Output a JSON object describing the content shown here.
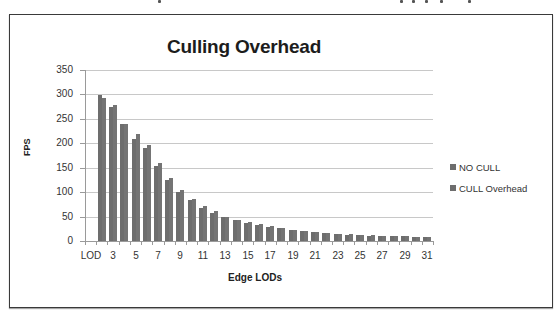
{
  "chart_data": {
    "type": "bar",
    "title": "Culling Overhead",
    "xlabel": "Edge LODs",
    "ylabel": "FPS",
    "ylim": [
      0,
      350
    ],
    "yticks": [
      0,
      50,
      100,
      150,
      200,
      250,
      300,
      350
    ],
    "grid": true,
    "legend_position": "right",
    "categories": [
      "LOD",
      "2",
      "3",
      "4",
      "5",
      "6",
      "7",
      "8",
      "9",
      "10",
      "11",
      "12",
      "13",
      "14",
      "15",
      "16",
      "17",
      "18",
      "19",
      "20",
      "21",
      "22",
      "23",
      "24",
      "25",
      "26",
      "27",
      "28",
      "29",
      "30",
      "31"
    ],
    "xtick_labels_shown": [
      "LOD",
      "3",
      "5",
      "7",
      "9",
      "11",
      "13",
      "15",
      "17",
      "19",
      "21",
      "23",
      "25",
      "27",
      "29",
      "31"
    ],
    "series": [
      {
        "name": "NO CULL",
        "color": "#6d6d6d",
        "values": [
          0,
          298,
          275,
          240,
          209,
          190,
          154,
          125,
          101,
          84,
          68,
          58,
          49,
          43,
          37,
          33,
          29,
          26,
          23,
          21,
          19,
          17,
          15,
          13,
          12,
          11,
          11,
          10,
          10,
          9,
          8
        ]
      },
      {
        "name": "CULL Overhead",
        "color": "#747474",
        "values": [
          0,
          292,
          278,
          239,
          219,
          197,
          160,
          128,
          104,
          87,
          72,
          61,
          50,
          44,
          38,
          34,
          30,
          26,
          23,
          21,
          19,
          17,
          15,
          14,
          13,
          12,
          11,
          10,
          10,
          9,
          8
        ]
      }
    ]
  },
  "chart": {
    "title": "Culling Overhead",
    "x_axis_title": "Edge LODs",
    "y_axis_title": "FPS",
    "legend": [
      {
        "label": "NO CULL"
      },
      {
        "label": "CULL Overhead"
      }
    ]
  }
}
